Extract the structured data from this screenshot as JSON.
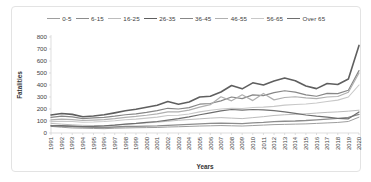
{
  "chart_data": {
    "type": "line",
    "title": "",
    "xlabel": "Years",
    "ylabel": "Fatalities",
    "ylim": [
      0,
      800
    ],
    "yticks": [
      0,
      100,
      200,
      300,
      400,
      500,
      600,
      700,
      800
    ],
    "grid": false,
    "legend_position": "top",
    "x": [
      1991,
      1992,
      1993,
      1994,
      1995,
      1996,
      1997,
      1998,
      1999,
      2000,
      2001,
      2002,
      2003,
      2004,
      2005,
      2006,
      2007,
      2008,
      2009,
      2010,
      2011,
      2012,
      2013,
      2014,
      2015,
      2016,
      2017,
      2018,
      2019,
      2020
    ],
    "series": [
      {
        "name": "0-5",
        "color": "#9e9e9e",
        "width": 1.0,
        "values": [
          55,
          48,
          42,
          40,
          38,
          36,
          40,
          42,
          44,
          45,
          46,
          50,
          52,
          55,
          58,
          60,
          62,
          60,
          58,
          62,
          66,
          70,
          72,
          74,
          76,
          80,
          84,
          88,
          96,
          132
        ]
      },
      {
        "name": "6-15",
        "color": "#8c8c8c",
        "width": 1.3,
        "values": [
          62,
          58,
          54,
          50,
          48,
          46,
          50,
          54,
          56,
          58,
          60,
          64,
          68,
          72,
          76,
          80,
          82,
          80,
          78,
          84,
          88,
          94,
          98,
          100,
          104,
          110,
          116,
          122,
          130,
          155
        ]
      },
      {
        "name": "16-25",
        "color": "#bcbcbc",
        "width": 1.0,
        "values": [
          80,
          74,
          68,
          64,
          62,
          60,
          66,
          72,
          78,
          84,
          90,
          98,
          106,
          112,
          118,
          124,
          128,
          124,
          120,
          128,
          136,
          146,
          152,
          156,
          160,
          166,
          172,
          176,
          182,
          190
        ]
      },
      {
        "name": "26-35",
        "color": "#5f5f5f",
        "width": 1.6,
        "values": [
          150,
          163,
          155,
          136,
          142,
          152,
          168,
          186,
          198,
          214,
          232,
          262,
          240,
          258,
          300,
          306,
          342,
          396,
          368,
          418,
          400,
          434,
          458,
          436,
          392,
          370,
          412,
          404,
          450,
          730
        ]
      },
      {
        "name": "36-45",
        "color": "#878787",
        "width": 1.2,
        "values": [
          130,
          140,
          134,
          120,
          126,
          130,
          140,
          152,
          160,
          172,
          186,
          206,
          200,
          212,
          240,
          246,
          268,
          300,
          286,
          318,
          312,
          336,
          352,
          340,
          318,
          306,
          330,
          328,
          356,
          520
        ]
      },
      {
        "name": "46-55",
        "color": "#b0b0b0",
        "width": 1.2,
        "values": [
          110,
          116,
          112,
          104,
          108,
          112,
          120,
          130,
          138,
          148,
          160,
          176,
          176,
          190,
          216,
          236,
          302,
          268,
          318,
          270,
          330,
          276,
          296,
          302,
          292,
          286,
          300,
          304,
          340,
          500
        ]
      },
      {
        "name": "56-65",
        "color": "#c8c8c8",
        "width": 1.1,
        "values": [
          95,
          98,
          96,
          90,
          92,
          96,
          102,
          110,
          116,
          124,
          132,
          146,
          148,
          158,
          176,
          190,
          200,
          206,
          204,
          212,
          216,
          222,
          232,
          238,
          242,
          250,
          262,
          274,
          300,
          400
        ]
      },
      {
        "name": "Over 65",
        "color": "#6e6e6e",
        "width": 1.2,
        "values": [
          60,
          62,
          58,
          54,
          56,
          60,
          66,
          74,
          80,
          88,
          96,
          108,
          120,
          134,
          152,
          168,
          184,
          196,
          190,
          196,
          192,
          186,
          176,
          164,
          150,
          140,
          132,
          122,
          118,
          175
        ]
      }
    ]
  }
}
